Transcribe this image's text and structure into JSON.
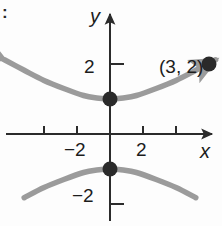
{
  "figure": {
    "corner_mark": ":",
    "background_color": "#fdfdfd"
  },
  "axes": {
    "x_label": "x",
    "y_label": "y",
    "axis_color": "#2b2b2b",
    "origin_px": {
      "x": 110,
      "y": 134
    },
    "unit_px": {
      "x": 33,
      "y": 35
    },
    "x_ticks": [
      {
        "value": -3,
        "label": ""
      },
      {
        "value": -2,
        "label": "−2"
      },
      {
        "value": 2,
        "label": "2"
      },
      {
        "value": 3,
        "label": ""
      }
    ],
    "y_ticks": [
      {
        "value": 2,
        "label": "2"
      },
      {
        "value": -2,
        "label": "−2"
      }
    ]
  },
  "chart_data": {
    "type": "line",
    "title": "",
    "subtitle": "",
    "xlabel": "x",
    "ylabel": "y",
    "xlim": [
      -3.5,
      3.4
    ],
    "ylim": [
      -3.2,
      3.1
    ],
    "grid": false,
    "legend": null,
    "curve_color": "#9b9b9b",
    "point_color": "#2a2a2a",
    "equation": "y^2 - x^2/3 = 1",
    "series": [
      {
        "name": "upper-branch",
        "description": "Upper branch of hyperbola, vertex at (0, 1), opens upward with arrowheads at both ends",
        "arrow_start": true,
        "arrow_end": true,
        "x": [
          -3.2,
          -2.6,
          -2.0,
          -1.4,
          -0.8,
          -0.4,
          0.0,
          0.4,
          0.8,
          1.4,
          2.0,
          2.6,
          3.2
        ],
        "y": [
          2.12,
          1.82,
          1.53,
          1.3,
          1.1,
          1.03,
          1.0,
          1.03,
          1.1,
          1.3,
          1.53,
          1.82,
          2.12
        ]
      },
      {
        "name": "lower-branch",
        "description": "Lower branch of hyperbola, vertex at (0, -1), opens downward",
        "arrow_start": false,
        "arrow_end": false,
        "x": [
          -2.6,
          -2.0,
          -1.4,
          -0.8,
          -0.4,
          0.0,
          0.4,
          0.8,
          1.4,
          2.0,
          2.6
        ],
        "y": [
          -1.82,
          -1.53,
          -1.3,
          -1.1,
          -1.03,
          -1.0,
          -1.03,
          -1.1,
          -1.3,
          -1.53,
          -1.82
        ]
      }
    ],
    "points": [
      {
        "name": "vertex-upper",
        "x": 0,
        "y": 1,
        "label": ""
      },
      {
        "name": "vertex-lower",
        "x": 0,
        "y": -1,
        "label": ""
      },
      {
        "name": "labeled-point",
        "x": 3,
        "y": 2,
        "label": "(3, 2)"
      }
    ],
    "annotations": [
      {
        "name": "point-label-a",
        "text": "(3, 2)",
        "x": 3,
        "y": 2
      }
    ]
  }
}
